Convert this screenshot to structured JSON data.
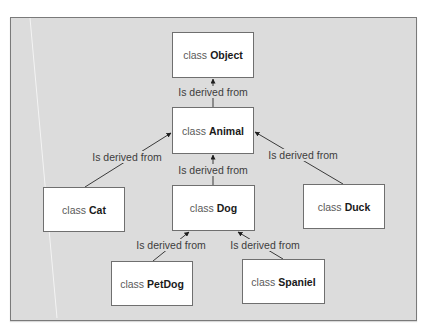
{
  "diagram": {
    "type": "class-inheritance-hierarchy",
    "colors": {
      "background": "#dcdcdc",
      "box_fill": "#ffffff",
      "box_border": "#6f6f6f",
      "edge": "#3a3a3a",
      "text": "#3d3d3d"
    },
    "keyword": "class",
    "nodes": [
      {
        "id": "object",
        "keyword": "class",
        "name": "Object"
      },
      {
        "id": "animal",
        "keyword": "class",
        "name": "Animal"
      },
      {
        "id": "cat",
        "keyword": "class",
        "name": "Cat"
      },
      {
        "id": "dog",
        "keyword": "class",
        "name": "Dog"
      },
      {
        "id": "duck",
        "keyword": "class",
        "name": "Duck"
      },
      {
        "id": "petdog",
        "keyword": "class",
        "name": "PetDog"
      },
      {
        "id": "spaniel",
        "keyword": "class",
        "name": "Spaniel"
      }
    ],
    "edges": [
      {
        "from": "animal",
        "to": "object",
        "label": "Is derived from"
      },
      {
        "from": "cat",
        "to": "animal",
        "label": "Is derived from"
      },
      {
        "from": "dog",
        "to": "animal",
        "label": "Is derived from"
      },
      {
        "from": "duck",
        "to": "animal",
        "label": "Is derived from"
      },
      {
        "from": "petdog",
        "to": "dog",
        "label": "Is derived from"
      },
      {
        "from": "spaniel",
        "to": "dog",
        "label": "Is derived from"
      }
    ]
  }
}
